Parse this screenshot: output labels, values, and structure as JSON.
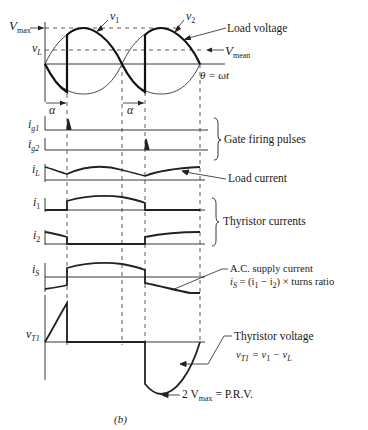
{
  "figure": {
    "caption": "(b)"
  },
  "axes_labels": {
    "vmax": "V",
    "vmax_sub": "max",
    "vl": "v",
    "vl_sub": "L",
    "v1": "v",
    "v1_sub": "1",
    "v2": "v",
    "v2_sub": "2",
    "alpha_1": "α",
    "alpha_2": "α",
    "theta": "θ = ωt",
    "ig1": "i",
    "ig1_sub": "g1",
    "ig2": "i",
    "ig2_sub": "g2",
    "il": "i",
    "il_sub": "L",
    "i1": "i",
    "i1_sub": "1",
    "i2": "i",
    "i2_sub": "2",
    "is": "i",
    "is_sub": "S",
    "vt1": "v",
    "vt1_sub": "T1"
  },
  "annotations": {
    "load_voltage": "Load voltage",
    "vmean": "V",
    "vmean_sub": "mean",
    "gate_pulses": "Gate firing pulses",
    "load_current": "Load current",
    "thyristor_currents": "Thyristor currents",
    "ac_supply": "A.C. supply current",
    "is_eq_a": "i",
    "is_eq_sub": "S",
    "is_eq_b": " = (i",
    "is_eq_sub1": "1",
    "is_eq_c": " − i",
    "is_eq_sub2": "2",
    "is_eq_d": ") × turns ratio",
    "thyristor_voltage": "Thyristor voltage",
    "vt_eq_a": "v",
    "vt_eq_sub_a": "T1",
    "vt_eq_b": " = v",
    "vt_eq_sub_b": "1",
    "vt_eq_c": " − v",
    "vt_eq_sub_c": "L",
    "prv_a": "2 V",
    "prv_sub": "max",
    "prv_b": " = P.R.V."
  },
  "colors": {
    "ink": "#1a1a1a",
    "thin": "#3a3a3a",
    "background": "#ffffff"
  }
}
